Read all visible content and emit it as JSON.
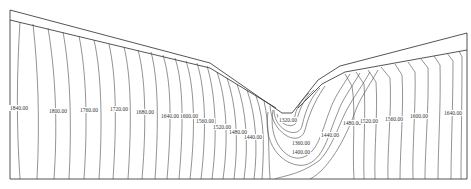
{
  "diagram": {
    "type": "contour-map",
    "colors": {
      "line": "#4a4a4a",
      "outline": "#2a2a2a",
      "background": "#ffffff",
      "label": "#333333"
    },
    "contour_labels": [
      {
        "text": "1840.00",
        "x": 9,
        "y": 108
      },
      {
        "text": "1800.00",
        "x": 49,
        "y": 111
      },
      {
        "text": "1760.00",
        "x": 80,
        "y": 110
      },
      {
        "text": "1720.00",
        "x": 110,
        "y": 109
      },
      {
        "text": "1680.00",
        "x": 136,
        "y": 111
      },
      {
        "text": "1640.00",
        "x": 161,
        "y": 114
      },
      {
        "text": "1600.00",
        "x": 180,
        "y": 114
      },
      {
        "text": "1560.00",
        "x": 196,
        "y": 119
      },
      {
        "text": "1520.00",
        "x": 213,
        "y": 125
      },
      {
        "text": "1480.00",
        "x": 229,
        "y": 130
      },
      {
        "text": "1440.00",
        "x": 244,
        "y": 135
      },
      {
        "text": "1320.00",
        "x": 279,
        "y": 118
      },
      {
        "text": "1360.00",
        "x": 292,
        "y": 141
      },
      {
        "text": "1400.00",
        "x": 292,
        "y": 150
      },
      {
        "text": "1440.00",
        "x": 321,
        "y": 133
      },
      {
        "text": "1480.00",
        "x": 342,
        "y": 122
      },
      {
        "text": "1520.00",
        "x": 360,
        "y": 119
      },
      {
        "text": "1560.00",
        "x": 384,
        "y": 117
      },
      {
        "text": "1600.00",
        "x": 409,
        "y": 114
      },
      {
        "text": "1640.00",
        "x": 443,
        "y": 111
      }
    ]
  }
}
